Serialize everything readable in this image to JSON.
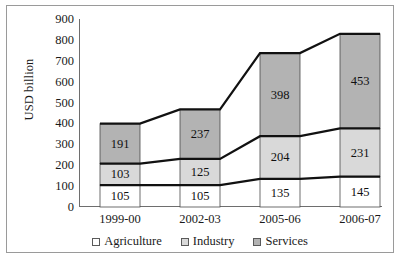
{
  "chart_data": {
    "type": "area",
    "title": "",
    "subtitle": "",
    "xlabel": "",
    "ylabel": "USD billion",
    "ylim": [
      0,
      900
    ],
    "ytick_step": 100,
    "yticks": [
      900,
      800,
      700,
      600,
      500,
      400,
      300,
      200,
      100,
      0
    ],
    "grid": false,
    "legend_position": "bottom",
    "stacked": true,
    "categories": [
      "1999-00",
      "2002-03",
      "2005-06",
      "2006-07"
    ],
    "series": [
      {
        "name": "Agriculture",
        "values": [
          105,
          105,
          135,
          145
        ],
        "color": "#ffffff"
      },
      {
        "name": "Industry",
        "values": [
          103,
          125,
          204,
          231
        ],
        "color": "#d9d9d9"
      },
      {
        "name": "Services",
        "values": [
          191,
          237,
          398,
          453
        ],
        "color": "#b3b3b3"
      }
    ],
    "cumulative_totals": [
      399,
      467,
      737,
      829
    ],
    "annotations": []
  },
  "legend": {
    "items": [
      {
        "label": "Agriculture",
        "swatch": "#ffffff"
      },
      {
        "label": "Industry",
        "swatch": "#d9d9d9"
      },
      {
        "label": "Services",
        "swatch": "#b3b3b3"
      }
    ]
  },
  "axis": {
    "y_title": "USD billion"
  }
}
